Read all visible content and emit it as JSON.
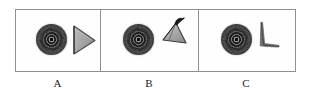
{
  "figure": {
    "kind": "three-panel-comparison-figure",
    "background_color": "#ffffff",
    "frame_color": "#8f8f8f",
    "label_color": "#1a1a1a"
  },
  "panels": [
    {
      "id": "A",
      "label": "A",
      "specimen": {
        "name": "ringed-circular-blob",
        "description": "dark concentric ringed disc",
        "fill_color": "#333333",
        "highlight_color": "#9c9c9c"
      },
      "shape": {
        "name": "right-pointing-triangle",
        "description": "solid gray triangle pointing right",
        "fill_color": "#a8a8a8",
        "stroke_color": "#4a4a4a",
        "orientation": "apex-right"
      }
    },
    {
      "id": "B",
      "label": "B",
      "specimen": {
        "name": "ringed-circular-blob",
        "description": "dark concentric ringed disc",
        "fill_color": "#333333",
        "highlight_color": "#9c9c9c"
      },
      "shape": {
        "name": "tilted-triangle-with-hook",
        "description": "gray triangle tilted with a dark curved hook at the apex",
        "fill_color": "#a8a8a8",
        "stroke_color": "#3c3c3c",
        "accent_color": "#1a1a1a",
        "orientation": "apex-upper-right"
      }
    },
    {
      "id": "C",
      "label": "C",
      "specimen": {
        "name": "ringed-circular-blob",
        "description": "dark concentric ringed disc",
        "fill_color": "#333333",
        "highlight_color": "#9c9c9c"
      },
      "shape": {
        "name": "edge-on-collapsed-triangle",
        "description": "thin L-shaped edge-on view of the triangle, nearly zero width",
        "fill_color": "#777777",
        "stroke_color": "#555555",
        "orientation": "edge-on"
      }
    }
  ]
}
